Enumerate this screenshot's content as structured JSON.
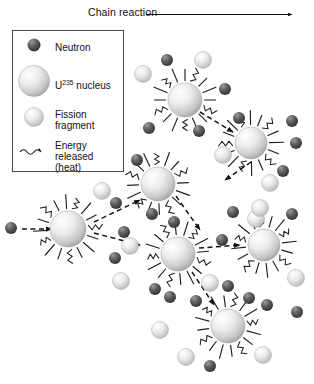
{
  "figure": {
    "header_label": "Chain reaction",
    "header_arrow": "right-arrow"
  },
  "legend": {
    "title": "",
    "items": [
      {
        "key": "neutron",
        "label": "Neutron",
        "label_line2": "",
        "glyph": "small-dark-sphere",
        "color": "#4a4a4a"
      },
      {
        "key": "nucleus",
        "label": "U",
        "sup": "235",
        "label_tail": " nucleus",
        "glyph": "large-light-sphere",
        "color": "#d8d8d8"
      },
      {
        "key": "fragment",
        "label": "Fission",
        "label_line2": "fragment",
        "glyph": "medium-light-sphere",
        "color": "#dcdcdc"
      },
      {
        "key": "energy",
        "label": "Energy",
        "label_line2": "released",
        "label_line3": "(heat)",
        "glyph": "wavy-arrow",
        "color": "#222222"
      }
    ]
  },
  "chart_data": {
    "type": "diagram",
    "title": "Chain reaction",
    "nuclei": [
      {
        "id": "n1",
        "x": 185,
        "y": 100,
        "r": 17
      },
      {
        "id": "n2",
        "x": 251,
        "y": 143,
        "r": 16
      },
      {
        "id": "n3",
        "x": 158,
        "y": 184,
        "r": 17
      },
      {
        "id": "n4",
        "x": 68,
        "y": 229,
        "r": 18
      },
      {
        "id": "n5",
        "x": 178,
        "y": 254,
        "r": 17
      },
      {
        "id": "n6",
        "x": 264,
        "y": 245,
        "r": 16
      },
      {
        "id": "n7",
        "x": 228,
        "y": 326,
        "r": 17
      }
    ],
    "neutrons": [
      {
        "x": 167,
        "y": 60
      },
      {
        "x": 225,
        "y": 89
      },
      {
        "x": 239,
        "y": 118
      },
      {
        "x": 149,
        "y": 128
      },
      {
        "x": 199,
        "y": 131
      },
      {
        "x": 137,
        "y": 160
      },
      {
        "x": 292,
        "y": 121
      },
      {
        "x": 296,
        "y": 143
      },
      {
        "x": 283,
        "y": 171
      },
      {
        "x": 11,
        "y": 228
      },
      {
        "x": 116,
        "y": 203
      },
      {
        "x": 124,
        "y": 232
      },
      {
        "x": 115,
        "y": 258
      },
      {
        "x": 152,
        "y": 214
      },
      {
        "x": 174,
        "y": 222
      },
      {
        "x": 222,
        "y": 240
      },
      {
        "x": 233,
        "y": 212
      },
      {
        "x": 228,
        "y": 286
      },
      {
        "x": 170,
        "y": 297
      },
      {
        "x": 249,
        "y": 298
      },
      {
        "x": 292,
        "y": 214
      },
      {
        "x": 297,
        "y": 312
      },
      {
        "x": 210,
        "y": 366
      },
      {
        "x": 196,
        "y": 301
      },
      {
        "x": 267,
        "y": 305
      },
      {
        "x": 155,
        "y": 289
      }
    ],
    "fragments": [
      {
        "x": 143,
        "y": 74
      },
      {
        "x": 203,
        "y": 60
      },
      {
        "x": 223,
        "y": 155
      },
      {
        "x": 270,
        "y": 183
      },
      {
        "x": 102,
        "y": 191
      },
      {
        "x": 121,
        "y": 281
      },
      {
        "x": 210,
        "y": 283
      },
      {
        "x": 160,
        "y": 330
      },
      {
        "x": 256,
        "y": 219
      },
      {
        "x": 296,
        "y": 278
      },
      {
        "x": 186,
        "y": 357
      },
      {
        "x": 263,
        "y": 355
      },
      {
        "x": 260,
        "y": 208
      },
      {
        "x": 130,
        "y": 246
      }
    ],
    "propagation_arrows": [
      {
        "from": "incoming",
        "x1": 22,
        "y1": 229,
        "x2": 52,
        "y2": 229
      },
      {
        "from": "n4",
        "x1": 94,
        "y1": 222,
        "x2": 140,
        "y2": 200
      },
      {
        "from": "n4",
        "x1": 94,
        "y1": 233,
        "x2": 140,
        "y2": 245
      },
      {
        "from": "n3",
        "x1": 176,
        "y1": 196,
        "x2": 200,
        "y2": 230
      },
      {
        "from": "n5",
        "x1": 199,
        "y1": 248,
        "x2": 240,
        "y2": 245
      },
      {
        "from": "n5",
        "x1": 192,
        "y1": 272,
        "x2": 214,
        "y2": 305
      },
      {
        "from": "n1",
        "x1": 200,
        "y1": 112,
        "x2": 233,
        "y2": 132
      },
      {
        "from": "n2",
        "x1": 251,
        "y1": 162,
        "x2": 225,
        "y2": 180
      }
    ]
  }
}
